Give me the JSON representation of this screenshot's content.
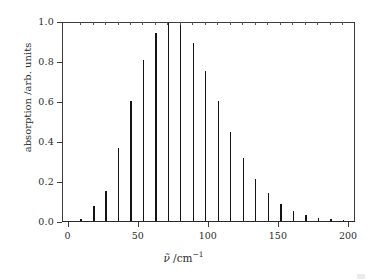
{
  "figure": {
    "background_color": "#ffffff",
    "line_color": "#141414",
    "frame_color": "#3b3b3b"
  },
  "axes": {
    "x": {
      "label_html": "&#957;&#771; /cm<sup>&#8722;1</sup>",
      "label_text": "ν̃ /cm⁻¹",
      "quantity": "ν̃",
      "unit": "cm⁻¹",
      "ticks": [
        0,
        50,
        100,
        150,
        200
      ],
      "tick_labels": [
        "0",
        "50",
        "100",
        "150",
        "200"
      ],
      "range": [
        -4,
        205
      ]
    },
    "y": {
      "label_text": "absorption /arb. units",
      "quantity": "absorption",
      "unit": "arb. units",
      "ticks": [
        0.0,
        0.2,
        0.4,
        0.6,
        0.8,
        1.0
      ],
      "tick_labels": [
        "0.0",
        "0.2",
        "0.4",
        "0.6",
        "0.8",
        "1.0"
      ],
      "range": [
        0.0,
        1.0
      ]
    }
  },
  "chart_data": {
    "type": "bar",
    "title": "",
    "subtitle": "",
    "xlabel": "ν̃ /cm⁻¹",
    "ylabel": "absorption /arb. units",
    "xlim": [
      -4,
      205
    ],
    "ylim": [
      0.0,
      1.0
    ],
    "grid": false,
    "legend": null,
    "annotations": [],
    "series_name": "rotational absorption lines",
    "line_spacing_cm1": 8.9,
    "x": [
      8.9,
      17.8,
      26.7,
      35.6,
      44.5,
      53.4,
      62.3,
      71.2,
      80.1,
      89.0,
      97.9,
      106.8,
      115.7,
      124.6,
      133.5,
      142.4,
      151.3,
      160.2,
      169.1,
      178.0,
      186.9,
      195.8
    ],
    "values": [
      0.012,
      0.075,
      0.148,
      0.363,
      0.598,
      0.805,
      0.942,
      1.0,
      0.978,
      0.888,
      0.752,
      0.598,
      0.447,
      0.316,
      0.21,
      0.138,
      0.086,
      0.05,
      0.028,
      0.015,
      0.008,
      0.004
    ],
    "categories": [
      "8.9",
      "17.8",
      "26.7",
      "35.6",
      "44.5",
      "53.4",
      "62.3",
      "71.2",
      "80.1",
      "89.0",
      "97.9",
      "106.8",
      "115.7",
      "124.6",
      "133.5",
      "142.4",
      "151.3",
      "160.2",
      "169.1",
      "178.0",
      "186.9",
      "195.8"
    ]
  }
}
